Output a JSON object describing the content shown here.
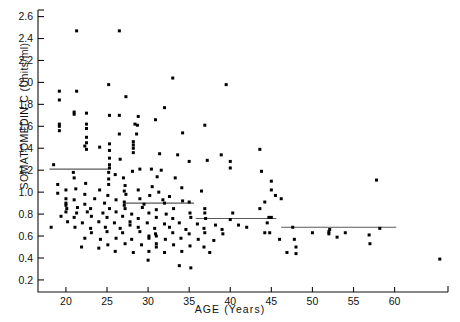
{
  "chart_data": {
    "type": "scatter",
    "title": "",
    "xlabel": "AGE (Years)",
    "ylabel": "SOMATOMEDIN-C (Units/ml)",
    "xlim": [
      16.6,
      66.5
    ],
    "ylim": [
      0.09,
      2.66
    ],
    "xticks": [
      20,
      25,
      30,
      35,
      40,
      45,
      50,
      55,
      60
    ],
    "xticklabels": [
      "20",
      "25",
      "30",
      "35",
      "40",
      "45",
      "50",
      "55",
      "60"
    ],
    "yticks": [
      0.2,
      0.4,
      0.6,
      0.8,
      1.0,
      1.2,
      1.4,
      1.6,
      1.8,
      2.0,
      2.2,
      2.4,
      2.6
    ],
    "yticklabels": [
      "0.2",
      "0.4",
      "0.6",
      "0.8",
      "1.0",
      "1.2",
      "1.4",
      "1.6",
      "1.8",
      "2.0",
      "2.2",
      "2.4",
      "2.6"
    ],
    "grid": false,
    "legend": null,
    "marker": "square",
    "marker_color": "#000000",
    "marker_size": 3,
    "segment_color": "#5a5a5a",
    "n_points": 208,
    "segments": [
      {
        "x0": 18.0,
        "x1": 25.2,
        "y": 1.21,
        "label": "median-18-25"
      },
      {
        "x0": 27.0,
        "x1": 35.6,
        "y": 0.9,
        "label": "median-27-35"
      },
      {
        "x0": 35.8,
        "x1": 45.6,
        "y": 0.76,
        "label": "median-36-45"
      },
      {
        "x0": 46.2,
        "x1": 60.2,
        "y": 0.68,
        "label": "median-46-60"
      }
    ],
    "points": [
      [
        21.3,
        2.47
      ],
      [
        26.5,
        2.47
      ],
      [
        25.2,
        1.98
      ],
      [
        33.0,
        2.04
      ],
      [
        39.5,
        1.98
      ],
      [
        19.2,
        1.92
      ],
      [
        21.3,
        1.92
      ],
      [
        27.3,
        1.87
      ],
      [
        32.0,
        1.77
      ],
      [
        21.0,
        1.73
      ],
      [
        21.0,
        1.71
      ],
      [
        22.5,
        1.72
      ],
      [
        25.3,
        1.7
      ],
      [
        26.5,
        1.7
      ],
      [
        28.8,
        1.69
      ],
      [
        30.9,
        1.66
      ],
      [
        19.2,
        1.62
      ],
      [
        19.2,
        1.6
      ],
      [
        22.5,
        1.62
      ],
      [
        22.5,
        1.58
      ],
      [
        28.4,
        1.62
      ],
      [
        28.7,
        1.61
      ],
      [
        36.9,
        1.61
      ],
      [
        19.2,
        1.56
      ],
      [
        34.2,
        1.54
      ],
      [
        22.5,
        1.5
      ],
      [
        26.5,
        1.53
      ],
      [
        22.5,
        1.45
      ],
      [
        22.3,
        1.42
      ],
      [
        24.1,
        1.41
      ],
      [
        25.3,
        1.44
      ],
      [
        28.2,
        1.46
      ],
      [
        28.2,
        1.43
      ],
      [
        22.5,
        1.39
      ],
      [
        25.3,
        1.38
      ],
      [
        28.2,
        1.4
      ],
      [
        28.2,
        1.36
      ],
      [
        31.4,
        1.35
      ],
      [
        33.6,
        1.34
      ],
      [
        38.9,
        1.34
      ],
      [
        25.3,
        1.31
      ],
      [
        26.6,
        1.3
      ],
      [
        35.0,
        1.28
      ],
      [
        43.6,
        1.39
      ],
      [
        18.5,
        1.25
      ],
      [
        25.3,
        1.25
      ],
      [
        25.3,
        1.22
      ],
      [
        29.0,
        1.21
      ],
      [
        40.0,
        1.28
      ],
      [
        40.0,
        1.22
      ],
      [
        25.2,
        1.18
      ],
      [
        28.1,
        1.19
      ],
      [
        30.4,
        1.21
      ],
      [
        31.6,
        1.2
      ],
      [
        43.8,
        1.19
      ],
      [
        21.0,
        1.13
      ],
      [
        25.2,
        1.12
      ],
      [
        27.0,
        1.13
      ],
      [
        31.1,
        1.14
      ],
      [
        33.3,
        1.13
      ],
      [
        19.0,
        1.07
      ],
      [
        22.4,
        1.08
      ],
      [
        25.2,
        1.07
      ],
      [
        27.2,
        1.06
      ],
      [
        30.5,
        1.05
      ],
      [
        34.1,
        1.04
      ],
      [
        45.0,
        1.1
      ],
      [
        20.0,
        1.02
      ],
      [
        21.2,
        1.03
      ],
      [
        24.1,
        1.02
      ],
      [
        27.1,
        1.01
      ],
      [
        28.8,
        1.02
      ],
      [
        31.3,
        1.0
      ],
      [
        36.5,
        1.01
      ],
      [
        45.0,
        1.02
      ],
      [
        19.0,
        0.99
      ],
      [
        22.3,
        0.98
      ],
      [
        25.1,
        0.97
      ],
      [
        27.3,
        0.98
      ],
      [
        30.2,
        0.97
      ],
      [
        32.6,
        0.96
      ],
      [
        45.5,
        0.97
      ],
      [
        20.0,
        0.94
      ],
      [
        21.0,
        0.93
      ],
      [
        23.5,
        0.94
      ],
      [
        26.1,
        0.93
      ],
      [
        29.0,
        0.94
      ],
      [
        31.8,
        0.93
      ],
      [
        34.2,
        0.92
      ],
      [
        46.2,
        0.94
      ],
      [
        20.0,
        0.9
      ],
      [
        20.0,
        0.88
      ],
      [
        22.3,
        0.89
      ],
      [
        24.7,
        0.9
      ],
      [
        27.1,
        0.91
      ],
      [
        27.1,
        0.88
      ],
      [
        29.5,
        0.89
      ],
      [
        32.0,
        0.9
      ],
      [
        35.0,
        0.91
      ],
      [
        44.2,
        0.91
      ],
      [
        20.1,
        0.85
      ],
      [
        21.4,
        0.86
      ],
      [
        23.0,
        0.85
      ],
      [
        25.3,
        0.85
      ],
      [
        27.2,
        0.85
      ],
      [
        29.3,
        0.86
      ],
      [
        31.0,
        0.84
      ],
      [
        33.1,
        0.85
      ],
      [
        36.9,
        0.85
      ],
      [
        43.6,
        0.85
      ],
      [
        20.0,
        0.82
      ],
      [
        21.3,
        0.81
      ],
      [
        22.6,
        0.82
      ],
      [
        24.5,
        0.81
      ],
      [
        26.1,
        0.82
      ],
      [
        28.0,
        0.8
      ],
      [
        30.1,
        0.81
      ],
      [
        32.2,
        0.8
      ],
      [
        35.1,
        0.81
      ],
      [
        36.9,
        0.81
      ],
      [
        40.3,
        0.81
      ],
      [
        19.4,
        0.78
      ],
      [
        21.0,
        0.77
      ],
      [
        23.1,
        0.78
      ],
      [
        25.0,
        0.77
      ],
      [
        26.9,
        0.78
      ],
      [
        28.8,
        0.76
      ],
      [
        31.0,
        0.77
      ],
      [
        33.0,
        0.76
      ],
      [
        35.2,
        0.77
      ],
      [
        37.0,
        0.76
      ],
      [
        40.0,
        0.75
      ],
      [
        44.7,
        0.77
      ],
      [
        45.0,
        0.77
      ],
      [
        20.2,
        0.73
      ],
      [
        22.0,
        0.72
      ],
      [
        24.0,
        0.73
      ],
      [
        25.9,
        0.72
      ],
      [
        27.8,
        0.73
      ],
      [
        27.8,
        0.7
      ],
      [
        29.9,
        0.72
      ],
      [
        32.0,
        0.71
      ],
      [
        33.8,
        0.72
      ],
      [
        36.0,
        0.71
      ],
      [
        38.2,
        0.7
      ],
      [
        44.5,
        0.72
      ],
      [
        21.1,
        0.68
      ],
      [
        23.0,
        0.67
      ],
      [
        24.8,
        0.68
      ],
      [
        26.6,
        0.67
      ],
      [
        28.8,
        0.68
      ],
      [
        30.8,
        0.67
      ],
      [
        32.6,
        0.68
      ],
      [
        34.6,
        0.66
      ],
      [
        36.8,
        0.67
      ],
      [
        39.0,
        0.66
      ],
      [
        47.6,
        0.68
      ],
      [
        52.1,
        0.66
      ],
      [
        58.2,
        0.67
      ],
      [
        18.2,
        0.68
      ],
      [
        23.1,
        0.63
      ],
      [
        25.0,
        0.64
      ],
      [
        26.9,
        0.63
      ],
      [
        29.0,
        0.64
      ],
      [
        30.9,
        0.62
      ],
      [
        33.0,
        0.63
      ],
      [
        35.0,
        0.62
      ],
      [
        36.9,
        0.63
      ],
      [
        39.1,
        0.62
      ],
      [
        44.2,
        0.63
      ],
      [
        44.8,
        0.63
      ],
      [
        50.0,
        0.63
      ],
      [
        52.0,
        0.64
      ],
      [
        52.0,
        0.62
      ],
      [
        54.0,
        0.63
      ],
      [
        53.0,
        0.59
      ],
      [
        22.3,
        0.58
      ],
      [
        24.2,
        0.57
      ],
      [
        26.1,
        0.58
      ],
      [
        28.0,
        0.57
      ],
      [
        30.1,
        0.58
      ],
      [
        32.1,
        0.57
      ],
      [
        34.0,
        0.58
      ],
      [
        36.1,
        0.57
      ],
      [
        38.0,
        0.56
      ],
      [
        46.0,
        0.57
      ],
      [
        47.8,
        0.57
      ],
      [
        21.9,
        0.5
      ],
      [
        25.1,
        0.52
      ],
      [
        27.2,
        0.53
      ],
      [
        29.2,
        0.52
      ],
      [
        31.0,
        0.53
      ],
      [
        31.0,
        0.5
      ],
      [
        33.1,
        0.52
      ],
      [
        35.1,
        0.51
      ],
      [
        36.8,
        0.5
      ],
      [
        48.0,
        0.5
      ],
      [
        57.0,
        0.53
      ],
      [
        26.0,
        0.46
      ],
      [
        28.2,
        0.45
      ],
      [
        30.1,
        0.46
      ],
      [
        32.0,
        0.45
      ],
      [
        34.1,
        0.46
      ],
      [
        37.5,
        0.45
      ],
      [
        46.9,
        0.45
      ],
      [
        48.0,
        0.44
      ],
      [
        30.0,
        0.38
      ],
      [
        33.8,
        0.33
      ],
      [
        65.5,
        0.39
      ],
      [
        35.2,
        0.31
      ],
      [
        19.2,
        1.84
      ],
      [
        28.6,
        1.53
      ],
      [
        37.2,
        1.29
      ],
      [
        30.1,
        0.6
      ],
      [
        31.0,
        0.6
      ],
      [
        24.0,
        0.49
      ],
      [
        20.9,
        1.18
      ],
      [
        26.0,
        1.16
      ],
      [
        42.0,
        0.68
      ],
      [
        41.0,
        0.7
      ],
      [
        57.8,
        1.11
      ],
      [
        56.9,
        0.61
      ]
    ]
  },
  "axis": {
    "tick_color": "#111111",
    "frame_color": "#111111"
  }
}
